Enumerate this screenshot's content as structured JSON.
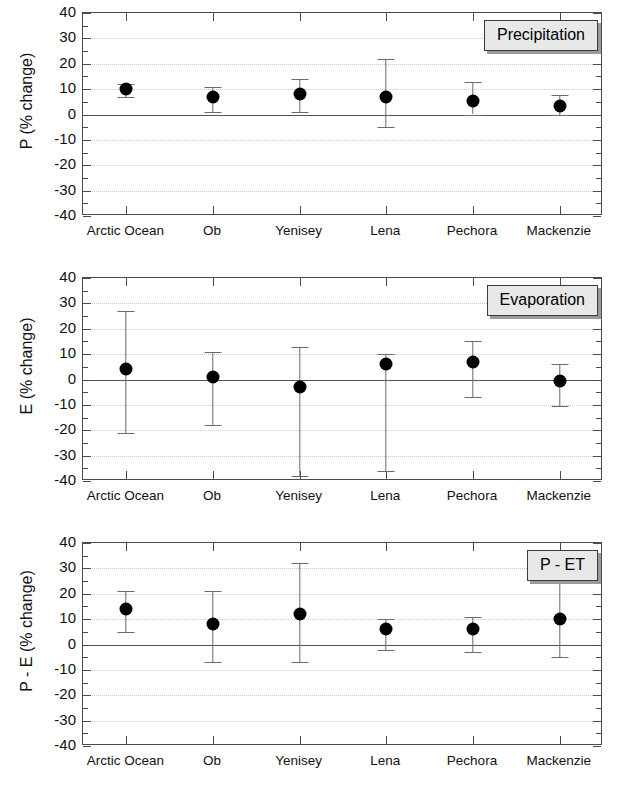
{
  "figure": {
    "width": 632,
    "height": 795,
    "background": "#ffffff",
    "marker_color": "#000000",
    "errorbar_color": "#6a6a6a",
    "axis_color": "#4b4b4b",
    "grid_color": "#c9c9c9",
    "zeroline_color": "#555555",
    "tag_fill": "#e8e8e8",
    "tag_border": "#3a3a3a"
  },
  "axis": {
    "ymin": -40,
    "ymax": 40,
    "ymajor_step": 10,
    "yminor_step": 5,
    "ytick_labels": [
      "40",
      "30",
      "20",
      "10",
      "0",
      "-10",
      "-20",
      "-30",
      "-40"
    ],
    "grid": true,
    "zero_line": true
  },
  "categories": [
    "Arctic Ocean",
    "Ob",
    "Yenisey",
    "Lena",
    "Pechora",
    "Mackenzie"
  ],
  "chart_data": [
    {
      "type": "scatter",
      "panel": 1,
      "title": "Precipitation",
      "xlabel": "",
      "ylabel": "P (% change)",
      "ylim": [
        -40,
        40
      ],
      "ytick_step": 10,
      "grid": true,
      "legend": "none",
      "categories": [
        "Arctic Ocean",
        "Ob",
        "Yenisey",
        "Lena",
        "Pechora",
        "Mackenzie"
      ],
      "values": [
        10.0,
        7.0,
        8.0,
        7.0,
        5.5,
        3.5
      ],
      "err_low": [
        7.0,
        1.0,
        1.0,
        -5.0,
        0.0,
        0.0
      ],
      "err_high": [
        12.0,
        11.0,
        14.0,
        22.0,
        13.0,
        7.5
      ]
    },
    {
      "type": "scatter",
      "panel": 2,
      "title": "Evaporation",
      "xlabel": "",
      "ylabel": "E (% change)",
      "ylim": [
        -40,
        40
      ],
      "ytick_step": 10,
      "grid": true,
      "legend": "none",
      "categories": [
        "Arctic Ocean",
        "Ob",
        "Yenisey",
        "Lena",
        "Pechora",
        "Mackenzie"
      ],
      "values": [
        4.0,
        1.0,
        -3.0,
        6.0,
        7.0,
        -0.5
      ],
      "err_low": [
        -21.0,
        -18.0,
        -38.0,
        -36.0,
        -7.0,
        -10.5
      ],
      "err_high": [
        27.0,
        11.0,
        13.0,
        10.0,
        15.0,
        6.0
      ]
    },
    {
      "type": "scatter",
      "panel": 3,
      "title": "P - ET",
      "xlabel": "",
      "ylabel": "P - E (% change)",
      "ylim": [
        -40,
        40
      ],
      "ytick_step": 10,
      "grid": true,
      "legend": "none",
      "categories": [
        "Arctic Ocean",
        "Ob",
        "Yenisey",
        "Lena",
        "Pechora",
        "Mackenzie"
      ],
      "values": [
        14.0,
        8.0,
        12.0,
        6.0,
        6.0,
        10.0
      ],
      "err_low": [
        5.0,
        -7.0,
        -7.0,
        -2.0,
        -3.0,
        -5.0
      ],
      "err_high": [
        21.0,
        21.0,
        32.0,
        10.0,
        11.0,
        25.0
      ]
    }
  ]
}
